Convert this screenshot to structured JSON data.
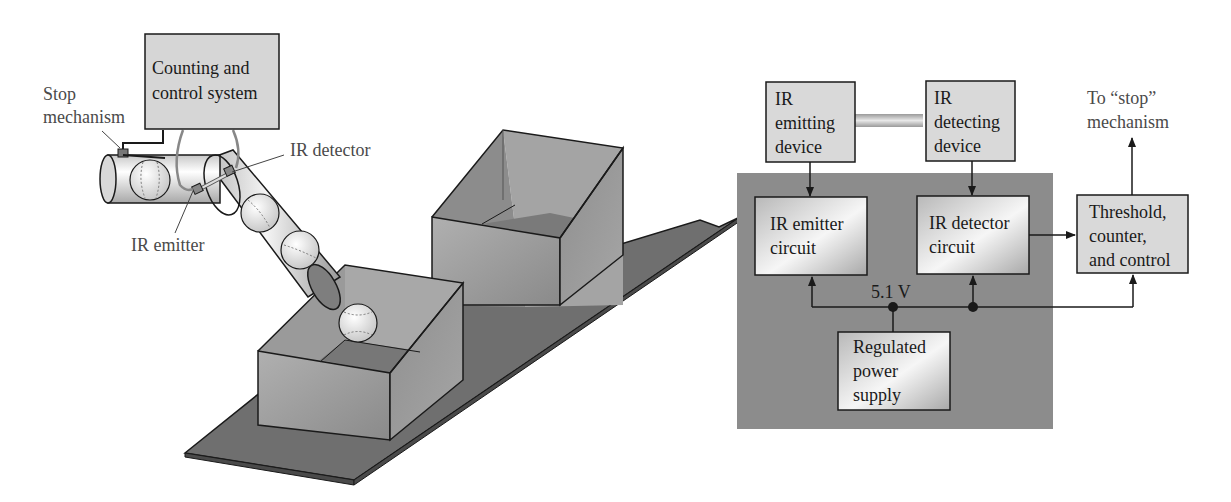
{
  "left_illustration": {
    "control_box_label": [
      "Counting and",
      "control system"
    ],
    "callouts": {
      "stop_mechanism": [
        "Stop",
        "mechanism"
      ],
      "ir_detector": "IR detector",
      "ir_emitter": "IR emitter"
    }
  },
  "block_diagram": {
    "ir_emitting_device": [
      "IR",
      "emitting",
      "device"
    ],
    "ir_detecting_device": [
      "IR",
      "detecting",
      "device"
    ],
    "ir_emitter_circuit": [
      "IR emitter",
      "circuit"
    ],
    "ir_detector_circuit": [
      "IR detector",
      "circuit"
    ],
    "threshold_block": [
      "Threshold,",
      "counter,",
      "and control"
    ],
    "power_supply": [
      "Regulated",
      "power",
      "supply"
    ],
    "voltage_label": "5.1 V",
    "stop_output_label": [
      "To “stop”",
      "mechanism"
    ],
    "colors": {
      "panel": "#8c8c8c",
      "block_fill": "#d9d9d9",
      "line": "#1a1a1a"
    }
  }
}
